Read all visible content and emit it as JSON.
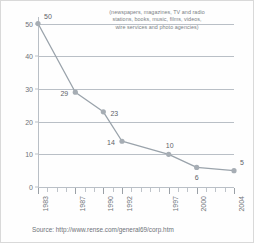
{
  "chart_data": {
    "type": "line",
    "title": "",
    "subtitle": "",
    "annotation": [
      "(newspapers, magazines, TV and radio",
      "stations, books, music, films, videos,",
      "wire services and photo agencies)"
    ],
    "x": [
      1983,
      1987,
      1990,
      1992,
      1997,
      2000,
      2004
    ],
    "categories": [
      "1983",
      "1987",
      "1990",
      "1992",
      "1997",
      "2000",
      "2004"
    ],
    "values": [
      50,
      29,
      23,
      14,
      10,
      6,
      5
    ],
    "point_labels": [
      "50",
      "29",
      "23",
      "14",
      "10",
      "6",
      "5"
    ],
    "xlabel": "",
    "ylabel": "",
    "xlim": [
      1983,
      2004
    ],
    "ylim": [
      0,
      52
    ],
    "yticks": [
      0,
      10,
      20,
      30,
      40,
      50
    ],
    "ytick_labels": [
      "0",
      "10",
      "20",
      "30",
      "40",
      "50"
    ],
    "grid": true,
    "grid_axis": "y",
    "legend": "none",
    "series_color": "#9aa3ab",
    "marker_color": "#a6adb4",
    "grid_color": "#b9bfc6",
    "text_color": "#6e7379"
  },
  "source": {
    "text": "Source: http://www.rense.com/general69/corp.htm"
  }
}
